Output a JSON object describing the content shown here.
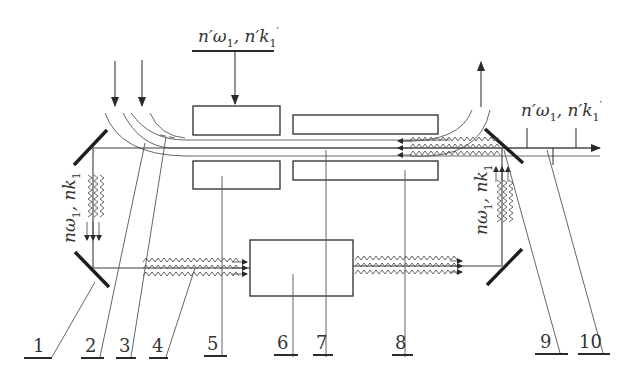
{
  "diagram": {
    "type": "optical-setup-schematic",
    "stroke_color": "#3a3a3a",
    "mirror_color": "#1e1e1e",
    "top_input_label": {
      "n": "n′ω",
      "sub": "1",
      "sep": ", ",
      "k": "n′k",
      "ksub": "1",
      "prime": "′"
    },
    "right_output_label": {
      "n": "n′ω",
      "sub": "1",
      "sep": ", ",
      "k": "n′k",
      "ksub": "1",
      "prime": "′"
    },
    "left_vertical_label": {
      "text": "nω",
      "sub": "1",
      "sep": ", ",
      "k": "nk",
      "ksub": "1"
    },
    "right_vertical_label": {
      "text": "nω",
      "sub": "1",
      "sep": ", ",
      "k": "nk",
      "ksub": "1"
    },
    "callouts": [
      {
        "id": "1",
        "label": "1"
      },
      {
        "id": "2",
        "label": "2"
      },
      {
        "id": "3",
        "label": "3"
      },
      {
        "id": "4",
        "label": "4"
      },
      {
        "id": "5",
        "label": "5"
      },
      {
        "id": "6",
        "label": "6"
      },
      {
        "id": "7",
        "label": "7"
      },
      {
        "id": "8",
        "label": "8"
      },
      {
        "id": "9",
        "label": "9"
      },
      {
        "id": "10",
        "label": "10"
      }
    ],
    "components": [
      {
        "name": "mirror-left-top"
      },
      {
        "name": "mirror-left-bottom"
      },
      {
        "name": "mirror-right-top"
      },
      {
        "name": "mirror-right-bottom"
      },
      {
        "name": "upper-block-5"
      },
      {
        "name": "lower-block-5"
      },
      {
        "name": "upper-block-8"
      },
      {
        "name": "lower-block-8"
      },
      {
        "name": "central-block-6"
      }
    ]
  }
}
